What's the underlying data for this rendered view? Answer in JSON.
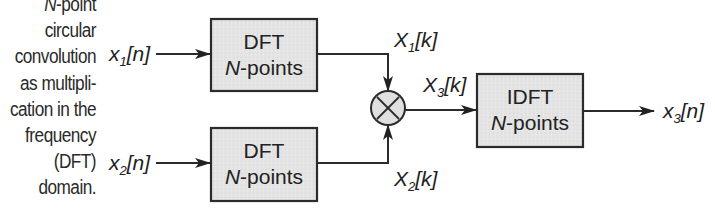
{
  "caption": {
    "lines": [
      {
        "prefix": "N",
        "text": "-point"
      },
      {
        "text": "circular"
      },
      {
        "text": "convolution"
      },
      {
        "text": "as multipli-"
      },
      {
        "text": "cation in the"
      },
      {
        "text": "frequency"
      },
      {
        "text": "(DFT)"
      },
      {
        "text": "domain."
      }
    ]
  },
  "inputs": {
    "x1": {
      "base": "x",
      "sub": "1",
      "arg": "[n]"
    },
    "x2": {
      "base": "x",
      "sub": "2",
      "arg": "[n]"
    }
  },
  "blocks": {
    "dft1": {
      "title": "DFT",
      "n": "N",
      "rest": "-points"
    },
    "dft2": {
      "title": "DFT",
      "n": "N",
      "rest": "-points"
    },
    "idft": {
      "title": "IDFT",
      "n": "N",
      "rest": "-points"
    }
  },
  "spectra": {
    "X1": {
      "base": "X",
      "sub": "1",
      "arg": "[k]"
    },
    "X2": {
      "base": "X",
      "sub": "2",
      "arg": "[k]"
    },
    "X3": {
      "base": "X",
      "sub": "3",
      "arg": "[k]"
    }
  },
  "output": {
    "base": "x",
    "sub": "3",
    "arg": "[n]"
  },
  "multiplier": {
    "symbol": "×"
  },
  "colors": {
    "block_fill": "#e4e4e4",
    "stroke": "#2b2b2b",
    "multiplier_fill": "#e0e0e0"
  }
}
